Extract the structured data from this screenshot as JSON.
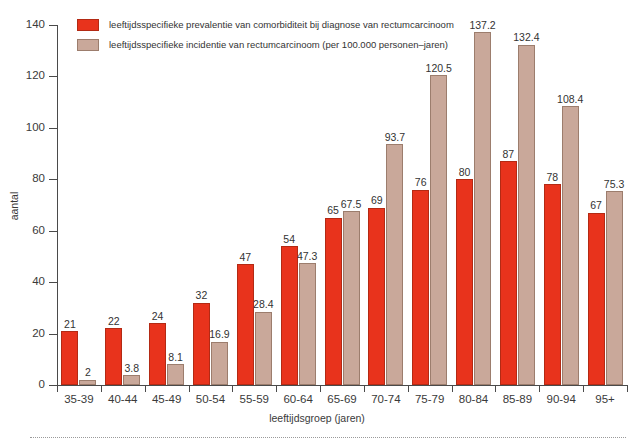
{
  "chart_data": {
    "type": "bar",
    "title": "",
    "xlabel": "leeftijdsgroep (jaren)",
    "ylabel": "aantal",
    "ylim": [
      0,
      140
    ],
    "yticks": [
      0,
      20,
      40,
      60,
      80,
      100,
      120,
      140
    ],
    "grid": false,
    "legend_position": "top-left",
    "categories": [
      "35-39",
      "40-44",
      "45-49",
      "50-54",
      "55-59",
      "60-64",
      "65-69",
      "70-74",
      "75-79",
      "80-84",
      "85-89",
      "90-94",
      "95+"
    ],
    "series": [
      {
        "name": "leeftijdsspecifieke prevalentie van comorbiditeit bij diagnose van rectumcarcinoom",
        "color": "#e8331c",
        "values": [
          21,
          22,
          24,
          32,
          47,
          54,
          65,
          69,
          76,
          80,
          87,
          78,
          67
        ],
        "labels": [
          "21",
          "22",
          "24",
          "32",
          "47",
          "54",
          "65",
          "69",
          "76",
          "80",
          "87",
          "78",
          "67"
        ]
      },
      {
        "name": "leeftijdsspecifieke incidentie van rectumcarcinoom (per 100.000 personen–jaren)",
        "color": "#c9a89a",
        "values": [
          2,
          3.8,
          8.1,
          16.9,
          28.4,
          47.3,
          67.5,
          93.7,
          120.5,
          137.2,
          132.4,
          108.4,
          75.3
        ],
        "labels": [
          "2",
          "3.8",
          "8.1",
          "16.9",
          "28.4",
          "47.3",
          "67.5",
          "93.7",
          "120.5",
          "137.2",
          "132.4",
          "108.4",
          "75.3"
        ]
      }
    ]
  },
  "legend": {
    "items": [
      {
        "label": "leeftijdsspecifieke prevalentie van comorbiditeit bij diagnose van rectumcarcinoom",
        "swatch": "prev"
      },
      {
        "label": "leeftijdsspecifieke incidentie van rectumcarcinoom (per 100.000 personen–jaren)",
        "swatch": "inc"
      }
    ]
  },
  "colors": {
    "prevalence": "#e8331c",
    "incidence": "#c9a89a",
    "axis": "#4a4a4a",
    "text": "#3a3a3a",
    "background": "#ffffff"
  }
}
